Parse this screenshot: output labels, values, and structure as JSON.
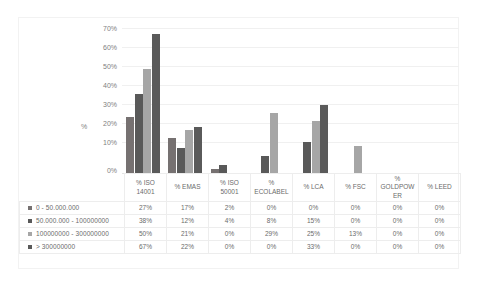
{
  "chart_data": {
    "type": "bar",
    "title": "",
    "xlabel": "",
    "ylabel": "%",
    "ylim": [
      0,
      70
    ],
    "ytick_labels": [
      "70%",
      "60%",
      "50%",
      "40%",
      "30%",
      "20%",
      "10%",
      "0%"
    ],
    "grid": true,
    "legend_position": "table-left",
    "categories": [
      "% ISO 14001",
      "% EMAS",
      "% ISO 50001",
      "% ECOLABEL",
      "% LCA",
      "% FSC",
      "% GOLDPOWER",
      "% LEED"
    ],
    "category_labels_wrapped": [
      [
        "% ISO",
        "14001"
      ],
      [
        "% EMAS",
        ""
      ],
      [
        "% ISO",
        "50001"
      ],
      [
        "%",
        "ECOLABEL"
      ],
      [
        "% LCA",
        ""
      ],
      [
        "% FSC",
        ""
      ],
      [
        "%",
        "GOLDPOW",
        "ER"
      ],
      [
        "% LEED",
        ""
      ]
    ],
    "series": [
      {
        "name": "0 - 50.000.000",
        "color": "#767171",
        "values": [
          27,
          17,
          2,
          0,
          0,
          0,
          0,
          0
        ],
        "labels": [
          "27%",
          "17%",
          "2%",
          "0%",
          "0%",
          "0%",
          "0%",
          "0%"
        ]
      },
      {
        "name": "50.000.000 - 100000000",
        "color": "#595959",
        "values": [
          38,
          12,
          4,
          8,
          15,
          0,
          0,
          0
        ],
        "labels": [
          "38%",
          "12%",
          "4%",
          "8%",
          "15%",
          "0%",
          "0%",
          "0%"
        ]
      },
      {
        "name": "100000000 - 300000000",
        "color": "#a6a6a6",
        "values": [
          50,
          21,
          0,
          29,
          25,
          13,
          0,
          0
        ],
        "labels": [
          "50%",
          "21%",
          "0%",
          "29%",
          "25%",
          "13%",
          "0%",
          "0%"
        ]
      },
      {
        "name": "> 300000000",
        "color": "#5a5a5a",
        "values": [
          67,
          22,
          0,
          0,
          33,
          0,
          0,
          0
        ],
        "labels": [
          "67%",
          "22%",
          "0%",
          "0%",
          "33%",
          "0%",
          "0%",
          "0%"
        ]
      }
    ]
  },
  "colors": {
    "series_1": "#767171",
    "series_2": "#595959",
    "series_3": "#a6a6a6",
    "series_4": "#5a5a5a",
    "gridline": "#f0f0f0",
    "border": "#f2f2f2",
    "text": "#808080"
  }
}
